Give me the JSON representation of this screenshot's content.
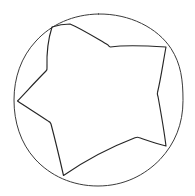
{
  "image": {
    "title": "Hand-drawn star inscribed in a circle",
    "medium": "line drawing",
    "background_color": "#ffffff",
    "ink_color": "#2b2b2b",
    "width": 195,
    "height": 196
  },
  "shapes": {
    "circle": {
      "name": "outer-circle",
      "stroke_color": "#3a3a3a",
      "stroke_width": 1.0,
      "center_x": 98.5,
      "center_y": 100,
      "radius_x": 84.5,
      "radius_y": 86,
      "path": "M 98.5 14 C 130 13.6 157.5 28 171 48.5 C 181 64 183 80 183 100.5 C 183 124 175 143.5 160 159.5 C 145 175 124 186 98 186 C 72 186 50 175.5 35 159 C 20.5 143 14 122 14 100 C 14 78 21 57 36 41 C 51 24.5 73 14.4 98.5 14 Z"
    },
    "star": {
      "name": "five-pointed-star",
      "stroke_color": "#262626",
      "stroke_width": 1.15,
      "outer_points": [
        {
          "label": "top-point",
          "x": 70,
          "y": 24
        },
        {
          "label": "upper-right-point",
          "x": 166,
          "y": 47
        },
        {
          "label": "lower-right-point",
          "x": 166,
          "y": 146
        },
        {
          "label": "bottom-point",
          "x": 63,
          "y": 176
        },
        {
          "label": "left-point",
          "x": 17,
          "y": 101
        }
      ],
      "inner_points": [
        {
          "label": "inner-top-right",
          "x": 110,
          "y": 47
        },
        {
          "label": "inner-right",
          "x": 157,
          "y": 93
        },
        {
          "label": "inner-bottom-right",
          "x": 137,
          "y": 137
        },
        {
          "label": "inner-bottom-left",
          "x": 50,
          "y": 122
        },
        {
          "label": "inner-top-left",
          "x": 47,
          "y": 70
        }
      ],
      "path": "M 70 24 C 82 29 96 38 108 45 C 109 46.5 109.5 47 110.5 47 C 124 45 142 45.5 166 47 C 163 63 161 78 157.5 92.5 C 157 94 157.5 95 158 96.5 C 161 113 164 130 166 146 C 155.5 143.5 146 140 138.5 137.5 C 137.5 137 136.5 137.2 135 137.8 C 111 147 86 160 63.5 175.5 C 60 160 56 143 51 124 C 50.4 122.6 50 122 48.6 121.4 C 38 114 27 107.5 17.5 101 C 27 91 37 80 46 71 C 47 70.2 47.2 69 47 67.5 C 46.5 53 48.5 38 52 27 C 58 25 64 24 70 24 Z"
    }
  }
}
